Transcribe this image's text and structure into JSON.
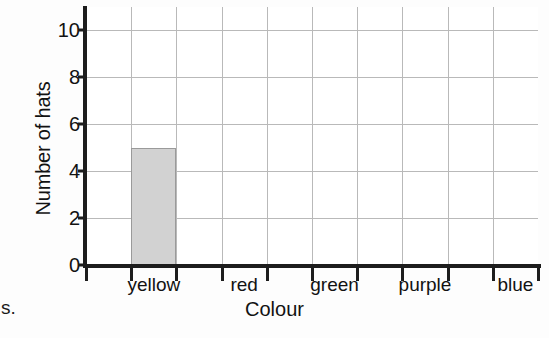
{
  "chart_data": {
    "type": "bar",
    "title": "",
    "categories": [
      "yellow",
      "red",
      "green",
      "purple",
      "blue"
    ],
    "values": [
      5,
      0,
      0,
      0,
      0
    ],
    "series": [
      {
        "name": "Number of hats",
        "values": [
          5,
          0,
          0,
          0,
          0
        ]
      }
    ],
    "xlabel": "Colour",
    "ylabel": "Number of hats",
    "ylim": [
      0,
      11
    ],
    "ytick_labels": [
      "0",
      "2",
      "4",
      "6",
      "8",
      "10"
    ],
    "ytick_values": [
      0,
      2,
      4,
      6,
      8,
      10
    ],
    "grid": true,
    "grid_columns": 10,
    "legend": "none",
    "bar_color": "#d2d2d2",
    "bar_edge_color": "#9a9a9a",
    "axis_color": "#1d1d1d",
    "grid_color": "#b9b9b9"
  },
  "annotations": {
    "page_fragment": "s."
  }
}
